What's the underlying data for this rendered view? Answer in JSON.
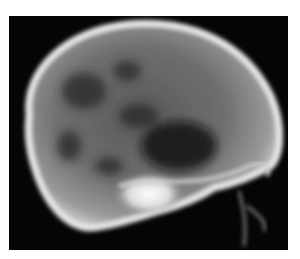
{
  "image": {
    "subject": "lateral skull x-ray radiograph",
    "background_color": "#050505",
    "page_background": "#ffffff",
    "bone_color": "#e8e8e8",
    "frame": {
      "x": 9,
      "y": 16,
      "width": 279,
      "height": 234
    }
  }
}
